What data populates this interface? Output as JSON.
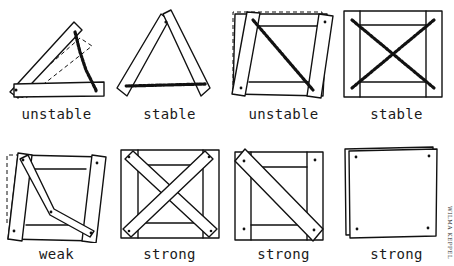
{
  "figure": {
    "panels": [
      {
        "id": "triangle-open",
        "label": "unstable",
        "brace": "chain, one side"
      },
      {
        "id": "triangle-closed",
        "label": "stable",
        "brace": "chain across base"
      },
      {
        "id": "frame-one-chain",
        "label": "unstable",
        "brace": "single chain diagonal"
      },
      {
        "id": "frame-cross-chain",
        "label": "stable",
        "brace": "crossed chains"
      },
      {
        "id": "frame-bent-board",
        "label": "weak",
        "brace": "bent board diagonal"
      },
      {
        "id": "frame-cross-boards",
        "label": "strong",
        "brace": "crossed boards"
      },
      {
        "id": "frame-one-board",
        "label": "strong",
        "brace": "single board diagonal"
      },
      {
        "id": "frame-panel",
        "label": "strong",
        "brace": "sheet panel"
      }
    ],
    "credit": "WILMA KEPPEL"
  },
  "colors": {
    "ink": "#111111",
    "background": "#ffffff"
  }
}
